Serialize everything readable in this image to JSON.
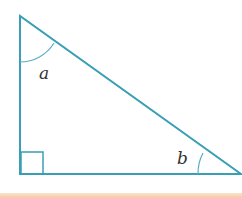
{
  "diagram": {
    "type": "right-triangle",
    "stroke_color": "#3a9fb5",
    "vertices": {
      "top": [
        20,
        16
      ],
      "bottom_left": [
        20,
        174
      ],
      "bottom_right": [
        241,
        174
      ]
    },
    "right_angle_at": "bottom_left",
    "angle_labels": [
      {
        "name": "a",
        "vertex": "top"
      },
      {
        "name": "b",
        "vertex": "bottom_right"
      }
    ]
  },
  "labels": {
    "angle_a": "a",
    "angle_b": "b"
  }
}
